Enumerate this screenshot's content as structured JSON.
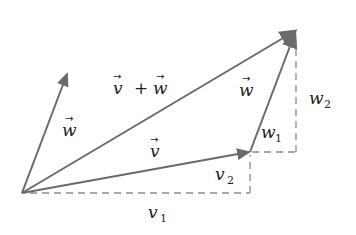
{
  "diagram": {
    "colors": {
      "vector": "#6a6a6a",
      "dashed": "#8a8a8a",
      "text": "#222222",
      "background": "#ffffff"
    },
    "points": {
      "origin": [
        22,
        193
      ],
      "v_tip": [
        250,
        152
      ],
      "w_tip": [
        68,
        72
      ],
      "sum_tip": [
        297,
        30
      ]
    },
    "vectors": [
      {
        "id": "v",
        "label": "v",
        "from": "origin",
        "to": "v_tip"
      },
      {
        "id": "w_origin",
        "label": "w",
        "from": "origin",
        "to": "w_tip"
      },
      {
        "id": "w_shifted",
        "label": "w",
        "from": "v_tip",
        "to": "sum_tip"
      },
      {
        "id": "sum",
        "label": "v + w",
        "from": "origin",
        "to": "sum_tip"
      }
    ],
    "labels": {
      "v_vec": "v",
      "w_vec_left": "w",
      "w_vec_right": "w",
      "sum_v": "v",
      "sum_plus": "+",
      "sum_w": "w",
      "v1": {
        "base": "v",
        "sub": "1"
      },
      "v2": {
        "base": "v",
        "sub": "2"
      },
      "w1": {
        "base": "w",
        "sub": "1"
      },
      "w2": {
        "base": "w",
        "sub": "2"
      }
    }
  }
}
